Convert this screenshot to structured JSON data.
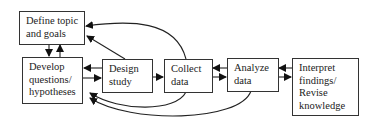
{
  "diagram": {
    "type": "flowchart",
    "nodes": [
      {
        "id": "define",
        "label": "Define topic\nand goals"
      },
      {
        "id": "develop",
        "label": "Develop\nquestions/\nhypotheses"
      },
      {
        "id": "design",
        "label": "Design\nstudy"
      },
      {
        "id": "collect",
        "label": "Collect\ndata"
      },
      {
        "id": "analyze",
        "label": "Analyze\ndata"
      },
      {
        "id": "interpret",
        "label": "Interpret\nfindings/\nRevise\nknowledge"
      }
    ],
    "edges": [
      {
        "from": "define",
        "to": "develop"
      },
      {
        "from": "develop",
        "to": "define"
      },
      {
        "from": "develop",
        "to": "design"
      },
      {
        "from": "design",
        "to": "develop"
      },
      {
        "from": "design",
        "to": "collect"
      },
      {
        "from": "collect",
        "to": "analyze"
      },
      {
        "from": "analyze",
        "to": "collect"
      },
      {
        "from": "analyze",
        "to": "interpret"
      },
      {
        "from": "interpret",
        "to": "analyze"
      },
      {
        "from": "design",
        "to": "define"
      },
      {
        "from": "collect",
        "to": "define"
      },
      {
        "from": "collect",
        "to": "develop"
      },
      {
        "from": "analyze",
        "to": "develop"
      }
    ]
  }
}
